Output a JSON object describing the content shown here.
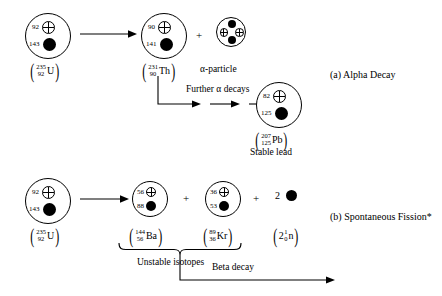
{
  "figure": {
    "alpha_decay": {
      "caption": "(a)  Alpha Decay",
      "parent": {
        "protons": "92",
        "neutrons": "143",
        "mass_number": "235",
        "atomic_number": "92",
        "symbol": "U"
      },
      "daughter": {
        "protons": "90",
        "neutrons": "141",
        "mass_number": "231",
        "atomic_number": "90",
        "symbol": "Th"
      },
      "emitted": {
        "label": "α-particle",
        "protons": 2,
        "neutrons": 2
      },
      "plus_sign": "+",
      "chain_label": "Further α decays",
      "final": {
        "protons": "82",
        "neutrons": "125",
        "mass_number": "207",
        "atomic_number": "125",
        "symbol": "Pb",
        "label": "Stable lead"
      }
    },
    "fission": {
      "caption": "(b)  Spontaneous Fission*",
      "parent": {
        "protons": "92",
        "neutrons": "143",
        "mass_number": "235",
        "atomic_number": "92",
        "symbol": "U"
      },
      "product_1": {
        "protons": "56",
        "neutrons": "88",
        "mass_number": "144",
        "atomic_number": "56",
        "symbol": "Ba"
      },
      "product_2": {
        "protons": "36",
        "neutrons": "53",
        "mass_number": "89",
        "atomic_number": "36",
        "symbol": "Kr"
      },
      "neutrons_released": {
        "coefficient": "2",
        "mass_number": "1",
        "atomic_number": "0",
        "symbol": "n",
        "prefix": "2"
      },
      "plus_sign_1": "+",
      "plus_sign_2": "+",
      "brace_label": "Unstable isotopes",
      "beta_label": "Beta decay"
    }
  },
  "colors": {
    "ink": "#000000",
    "background": "#ffffff"
  }
}
